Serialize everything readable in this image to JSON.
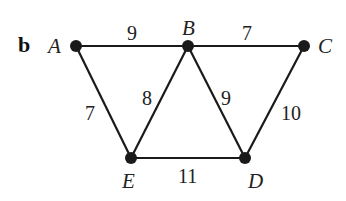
{
  "panel_label": "b",
  "nodes": [
    {
      "id": "A",
      "label": "A",
      "x": 76,
      "y": 46
    },
    {
      "id": "B",
      "label": "B",
      "x": 188,
      "y": 46
    },
    {
      "id": "C",
      "label": "C",
      "x": 304,
      "y": 46
    },
    {
      "id": "E",
      "label": "E",
      "x": 131,
      "y": 158
    },
    {
      "id": "D",
      "label": "D",
      "x": 245,
      "y": 158
    }
  ],
  "edges": [
    {
      "from": "A",
      "to": "B",
      "weight": "9"
    },
    {
      "from": "B",
      "to": "C",
      "weight": "7"
    },
    {
      "from": "A",
      "to": "E",
      "weight": "7"
    },
    {
      "from": "B",
      "to": "E",
      "weight": "8"
    },
    {
      "from": "B",
      "to": "D",
      "weight": "9"
    },
    {
      "from": "C",
      "to": "D",
      "weight": "10"
    },
    {
      "from": "E",
      "to": "D",
      "weight": "11"
    }
  ]
}
